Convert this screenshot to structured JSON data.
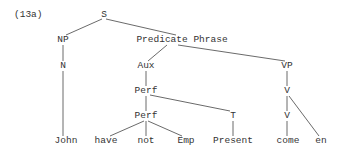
{
  "example_label": "(13a)",
  "nodes": {
    "S": "S",
    "NP": "NP",
    "N": "N",
    "PredP": "Predicate Phrase",
    "Aux": "Aux",
    "VP": "VP",
    "Perf1": "Perf",
    "Perf2": "Perf",
    "V1": "V",
    "V2": "V",
    "T": "T"
  },
  "leaves": {
    "john": "John",
    "have": "have",
    "not": "not",
    "emp": "Emp",
    "present": "Present",
    "come": "come",
    "en": "en"
  },
  "line_color": "#444444"
}
